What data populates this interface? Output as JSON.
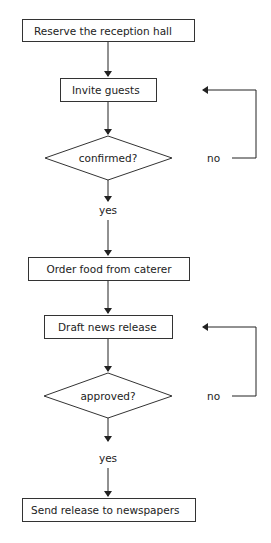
{
  "diagram": {
    "type": "flowchart",
    "nodes": [
      {
        "id": "n1",
        "shape": "rect",
        "label": "Reserve the reception hall"
      },
      {
        "id": "n2",
        "shape": "rect",
        "label": "Invite guests"
      },
      {
        "id": "d1",
        "shape": "diamond",
        "label": "confirmed?"
      },
      {
        "id": "n3",
        "shape": "rect",
        "label": "Order food from caterer"
      },
      {
        "id": "n4",
        "shape": "rect",
        "label": "Draft news release"
      },
      {
        "id": "d2",
        "shape": "diamond",
        "label": "approved?"
      },
      {
        "id": "n5",
        "shape": "rect",
        "label": "Send release to newspapers"
      }
    ],
    "edges": [
      {
        "from": "n1",
        "to": "n2",
        "label": ""
      },
      {
        "from": "n2",
        "to": "d1",
        "label": ""
      },
      {
        "from": "d1",
        "to": "n3",
        "label": "yes"
      },
      {
        "from": "d1",
        "to": "n2",
        "label": "no"
      },
      {
        "from": "n3",
        "to": "n4",
        "label": ""
      },
      {
        "from": "n4",
        "to": "d2",
        "label": ""
      },
      {
        "from": "d2",
        "to": "n5",
        "label": "yes"
      },
      {
        "from": "d2",
        "to": "n4",
        "label": "no"
      }
    ],
    "edge_labels": {
      "d1_yes": "yes",
      "d1_no": "no",
      "d2_yes": "yes",
      "d2_no": "no"
    },
    "colors": {
      "stroke": "#333333",
      "text": "#222222",
      "background": "#ffffff"
    }
  }
}
